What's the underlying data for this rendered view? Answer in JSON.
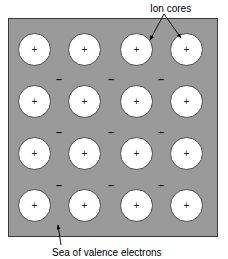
{
  "figure": {
    "background_color": "#ffffff",
    "panel": {
      "fill_color": "#9a9a9a",
      "border_color": "#3a3a3a",
      "x": 8,
      "y": 18,
      "width": 210,
      "height": 219
    }
  },
  "labels": {
    "ion_cores": "Ion cores",
    "sea_of_valence_electrons": "Sea of valence electrons"
  },
  "lattice": {
    "rows": 4,
    "columns": 4,
    "circle_diameter": 33,
    "circle_fill": "#ffffff",
    "circle_stroke": "#4a4a4a",
    "charge_symbol": "+",
    "ion_cores": [
      {
        "row": 0,
        "col": 0,
        "x": 18,
        "y": 33,
        "charge": "+"
      },
      {
        "row": 0,
        "col": 1,
        "x": 68,
        "y": 33,
        "charge": "+"
      },
      {
        "row": 0,
        "col": 2,
        "x": 120,
        "y": 33,
        "charge": "+"
      },
      {
        "row": 0,
        "col": 3,
        "x": 170,
        "y": 33,
        "charge": "+"
      },
      {
        "row": 1,
        "col": 0,
        "x": 18,
        "y": 85,
        "charge": "+"
      },
      {
        "row": 1,
        "col": 1,
        "x": 68,
        "y": 85,
        "charge": "+"
      },
      {
        "row": 1,
        "col": 2,
        "x": 120,
        "y": 85,
        "charge": "+"
      },
      {
        "row": 1,
        "col": 3,
        "x": 170,
        "y": 85,
        "charge": "+"
      },
      {
        "row": 2,
        "col": 0,
        "x": 18,
        "y": 137,
        "charge": "+"
      },
      {
        "row": 2,
        "col": 1,
        "x": 68,
        "y": 137,
        "charge": "+"
      },
      {
        "row": 2,
        "col": 2,
        "x": 120,
        "y": 137,
        "charge": "+"
      },
      {
        "row": 2,
        "col": 3,
        "x": 170,
        "y": 137,
        "charge": "+"
      },
      {
        "row": 3,
        "col": 0,
        "x": 18,
        "y": 189,
        "charge": "+"
      },
      {
        "row": 3,
        "col": 1,
        "x": 68,
        "y": 189,
        "charge": "+"
      },
      {
        "row": 3,
        "col": 2,
        "x": 120,
        "y": 189,
        "charge": "+"
      },
      {
        "row": 3,
        "col": 3,
        "x": 170,
        "y": 189,
        "charge": "+"
      }
    ],
    "valence_electrons": [
      {
        "x": 56,
        "y": 74,
        "charge": "–"
      },
      {
        "x": 108,
        "y": 74,
        "charge": "–"
      },
      {
        "x": 158,
        "y": 74,
        "charge": "–"
      },
      {
        "x": 56,
        "y": 127,
        "charge": "–"
      },
      {
        "x": 108,
        "y": 127,
        "charge": "–"
      },
      {
        "x": 158,
        "y": 127,
        "charge": "–"
      },
      {
        "x": 56,
        "y": 180,
        "charge": "–"
      },
      {
        "x": 108,
        "y": 180,
        "charge": "–"
      },
      {
        "x": 158,
        "y": 180,
        "charge": "–"
      }
    ]
  },
  "annotations": {
    "ion_cores_leader": {
      "color": "#000000",
      "fork_origin": {
        "x": 164,
        "y": 14
      },
      "branches": [
        {
          "to_x": 150,
          "to_y": 40
        },
        {
          "to_x": 181,
          "to_y": 38
        }
      ]
    },
    "sea_leader": {
      "color": "#000000",
      "from": {
        "x": 61,
        "y": 245
      },
      "to": {
        "x": 58,
        "y": 225
      }
    }
  }
}
